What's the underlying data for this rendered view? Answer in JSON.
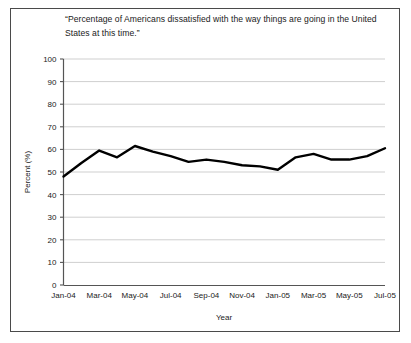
{
  "chart_data": {
    "type": "line",
    "title": "“Percentage of Americans dissatisfied with the way things are going in the United States at this time.”",
    "xlabel": "Year",
    "ylabel": "Percent (%)",
    "ylim": [
      0,
      100
    ],
    "ytick_labels": [
      "0",
      "10",
      "20",
      "30",
      "40",
      "50",
      "60",
      "70",
      "80",
      "90",
      "100"
    ],
    "yticks": [
      0,
      10,
      20,
      30,
      40,
      50,
      60,
      70,
      80,
      90,
      100
    ],
    "xtick_labels": [
      "Jan-04",
      "Mar-04",
      "May-04",
      "Jul-04",
      "Sep-04",
      "Nov-04",
      "Jan-05",
      "Mar-05",
      "May-05",
      "Jul-05"
    ],
    "grid": "horizontal",
    "legend": "none",
    "line_color": "#000000",
    "line_width": 2.4,
    "x": [
      "Jan-04",
      "Feb-04",
      "Mar-04",
      "Apr-04",
      "May-04",
      "Jun-04",
      "Jul-04",
      "Aug-04",
      "Sep-04",
      "Oct-04",
      "Nov-04",
      "Dec-04",
      "Jan-05",
      "Feb-05",
      "Mar-05",
      "Apr-05",
      "May-05",
      "Jun-05",
      "Jul-05"
    ],
    "values": [
      48,
      54,
      59.5,
      56.5,
      61.5,
      59,
      57,
      54.5,
      55.5,
      54.5,
      53,
      52.5,
      51,
      56.5,
      58,
      55.5,
      55.5,
      57,
      60.5
    ]
  }
}
